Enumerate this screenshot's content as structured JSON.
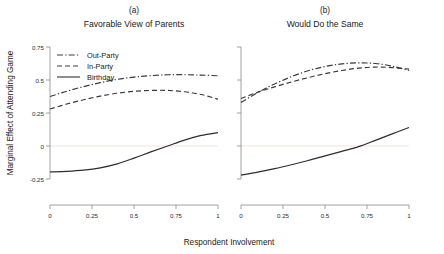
{
  "figure": {
    "xlabel": "Respondent Involvement",
    "ylabel": "Marginal Effect of Attending Game",
    "legend": {
      "items": [
        {
          "label": "Out-Party",
          "style": "dashdot"
        },
        {
          "label": "In-Party",
          "style": "dashed"
        },
        {
          "label": "Birthday",
          "style": "solid"
        }
      ],
      "position": "top-left of panel (a)"
    },
    "colors": {
      "line": "#3a3a3a",
      "axis": "#8a8a8a",
      "zero_gridline": "#f2dede",
      "background": "#ffffff"
    }
  },
  "chart_data": [
    {
      "type": "line",
      "panel": "a",
      "letter": "(a)",
      "title": "Favorable View of Parents",
      "xlabel": "Respondent Involvement",
      "ylabel": "Marginal Effect of Attending Game",
      "xlim": [
        0,
        1
      ],
      "ylim": [
        -0.3,
        0.78
      ],
      "xticks": [
        0,
        0.25,
        0.5,
        0.75,
        1
      ],
      "xticklabels": [
        "0",
        "0.25",
        "0.5",
        "0.75",
        "1"
      ],
      "yticks": [
        -0.25,
        0,
        0.25,
        0.5,
        0.75
      ],
      "yticklabels": [
        "-0.25",
        "0",
        "0.25",
        "0.5",
        "0.75"
      ],
      "grid": false,
      "zero_line": 0,
      "x": [
        0,
        0.1,
        0.2,
        0.3,
        0.4,
        0.5,
        0.6,
        0.7,
        0.8,
        0.9,
        1
      ],
      "series": [
        {
          "name": "Out-Party",
          "style": "dashdot",
          "values": [
            0.375,
            0.415,
            0.45,
            0.48,
            0.505,
            0.522,
            0.533,
            0.54,
            0.54,
            0.537,
            0.532
          ]
        },
        {
          "name": "In-Party",
          "style": "dashed",
          "values": [
            0.28,
            0.318,
            0.35,
            0.378,
            0.4,
            0.414,
            0.421,
            0.421,
            0.411,
            0.39,
            0.355
          ]
        },
        {
          "name": "Birthday",
          "style": "solid",
          "values": [
            -0.196,
            -0.192,
            -0.183,
            -0.165,
            -0.135,
            -0.092,
            -0.045,
            0.0,
            0.045,
            0.08,
            0.102
          ]
        }
      ]
    },
    {
      "type": "line",
      "panel": "b",
      "letter": "(b)",
      "title": "Would Do the Same",
      "xlabel": "Respondent Involvement",
      "ylabel": "Marginal Effect of Attending Game",
      "xlim": [
        0,
        1
      ],
      "ylim": [
        -0.3,
        0.78
      ],
      "xticks": [
        0,
        0.25,
        0.5,
        0.75,
        1
      ],
      "xticklabels": [
        "0",
        "0.25",
        "0.5",
        "0.75",
        "1"
      ],
      "yticks": [
        -0.25,
        0,
        0.25,
        0.5,
        0.75
      ],
      "yticklabels": [
        "-0.25",
        "0",
        "0.25",
        "0.5",
        "0.75"
      ],
      "grid": false,
      "zero_line": 0,
      "x": [
        0,
        0.1,
        0.2,
        0.3,
        0.4,
        0.5,
        0.6,
        0.7,
        0.8,
        0.9,
        1
      ],
      "series": [
        {
          "name": "Out-Party",
          "style": "dashdot",
          "values": [
            0.33,
            0.405,
            0.47,
            0.525,
            0.57,
            0.602,
            0.622,
            0.63,
            0.625,
            0.605,
            0.572
          ]
        },
        {
          "name": "In-Party",
          "style": "dashed",
          "values": [
            0.36,
            0.408,
            0.448,
            0.485,
            0.518,
            0.548,
            0.572,
            0.59,
            0.598,
            0.594,
            0.582
          ]
        },
        {
          "name": "Birthday",
          "style": "solid",
          "values": [
            -0.22,
            -0.198,
            -0.172,
            -0.142,
            -0.11,
            -0.075,
            -0.04,
            -0.005,
            0.043,
            0.092,
            0.14
          ]
        }
      ]
    }
  ]
}
